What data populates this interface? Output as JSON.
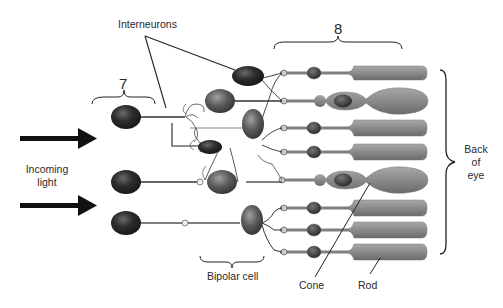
{
  "labels": {
    "interneurons": "Interneurons",
    "ganglion_group_number": "7",
    "photoreceptor_group_number": "8",
    "incoming_light_line1": "Incoming",
    "incoming_light_line2": "light",
    "back_of_eye_line1": "Back",
    "back_of_eye_line2": "of",
    "back_of_eye_line3": "eye",
    "bipolar_cell": "Bipolar cell",
    "cone": "Cone",
    "rod": "Rod"
  },
  "colors": {
    "photoreceptor_body": "#8a8a8a",
    "photoreceptor_nucleus": "#3a3a3a",
    "ganglion_cell": "#2b2b2b",
    "bipolar_cell": "#6a6a6a",
    "interneuron": "#1e1e1e",
    "line": "#222222",
    "axon": "#7a7a7a"
  },
  "photoreceptors": [
    {
      "type": "rod",
      "y": 73
    },
    {
      "type": "cone",
      "y": 101
    },
    {
      "type": "rod",
      "y": 128
    },
    {
      "type": "rod",
      "y": 152
    },
    {
      "type": "cone",
      "y": 178
    },
    {
      "type": "rod",
      "y": 208
    },
    {
      "type": "rod",
      "y": 230
    },
    {
      "type": "rod",
      "y": 252
    }
  ],
  "arrows": [
    {
      "y": 138
    },
    {
      "y": 205
    }
  ]
}
